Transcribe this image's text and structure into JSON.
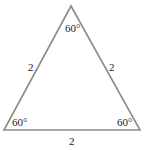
{
  "diagram": {
    "type": "equilateral-triangle",
    "colors": {
      "edge": "#8a8a8a",
      "text": "#222222",
      "background": "#ffffff"
    },
    "vertices": {
      "top": {
        "x": 71,
        "y": 6
      },
      "bottom_left": {
        "x": 4,
        "y": 130
      },
      "bottom_right": {
        "x": 140,
        "y": 130
      }
    },
    "angles": {
      "top": "60°",
      "bottom_left": "60°",
      "bottom_right": "60°"
    },
    "sides": {
      "left": "2",
      "right": "2",
      "bottom": "2"
    }
  }
}
